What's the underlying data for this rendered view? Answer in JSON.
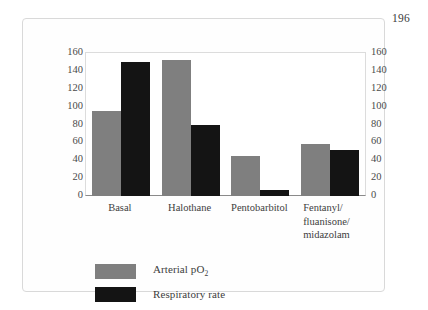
{
  "page": {
    "number": "196"
  },
  "chart_data": {
    "type": "bar",
    "title": "",
    "xlabel": "",
    "ylabel": "",
    "ylim": [
      0,
      160
    ],
    "ytick_step": 20,
    "grid": false,
    "legend_position": "below-left",
    "dual_axis": true,
    "categories": [
      "Basal",
      "Halothane",
      "Pentobarbitol",
      "Fentanyl/\nfluanisone/\nmidazolam"
    ],
    "yticks": [
      "160",
      "140",
      "120",
      "100",
      "80",
      "60",
      "40",
      "20",
      "0"
    ],
    "yticks_right": [
      "160",
      "140",
      "120",
      "100",
      "80",
      "60",
      "40",
      "20",
      "0"
    ],
    "series": [
      {
        "name": "Arterial pO",
        "name_sub": "2",
        "color": "#7f7f7f",
        "values": [
          95,
          152,
          45,
          58
        ]
      },
      {
        "name": "Respiratory rate",
        "name_sub": "",
        "color": "#141414",
        "values": [
          150,
          80,
          7,
          51
        ]
      }
    ]
  }
}
